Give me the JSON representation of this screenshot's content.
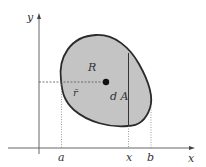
{
  "diagram": {
    "axes": {
      "x_label": "x",
      "y_label": "y"
    },
    "ticks": {
      "a": "a",
      "x": "x",
      "b": "b"
    },
    "region_label": "R",
    "centroid_label": "r̄",
    "element_label": "d A",
    "colors": {
      "region_fill": "#c4c4c4",
      "outline": "#2a2a2a",
      "axis": "#555555"
    }
  }
}
